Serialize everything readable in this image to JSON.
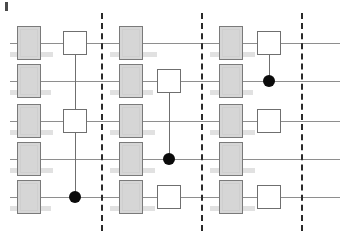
{
  "figure": {
    "kind": "quantum-circuit-diagram",
    "width": 347,
    "height": 243,
    "background": "#ffffff",
    "corner_mark": {
      "x": 5,
      "y": 2,
      "w": 3,
      "h": 9,
      "color": "#4a4a4a"
    }
  },
  "colors": {
    "wire": "#8e8e8e",
    "barrier": "#2a2a2a",
    "gate_fill": "#d6d6d6",
    "gate_stroke": "#7a7a7a",
    "square_fill": "#ffffff",
    "square_stroke": "#6f6f6f",
    "control_dot": "#0b0b0b",
    "label_smudge": "#dcdcdc"
  },
  "wires": [
    {
      "name": "qubit-wire-0",
      "y": 43,
      "x1": 10,
      "x2": 340
    },
    {
      "name": "qubit-wire-1",
      "y": 81,
      "x1": 10,
      "x2": 340
    },
    {
      "name": "qubit-wire-2",
      "y": 121,
      "x1": 10,
      "x2": 340
    },
    {
      "name": "qubit-wire-3",
      "y": 159,
      "x1": 10,
      "x2": 340
    },
    {
      "name": "qubit-wire-4",
      "y": 197,
      "x1": 10,
      "x2": 340
    }
  ],
  "barriers": [
    {
      "name": "barrier-1",
      "x": 101,
      "y1": 13,
      "y2": 231
    },
    {
      "name": "barrier-2",
      "x": 201,
      "y1": 13,
      "y2": 231
    },
    {
      "name": "barrier-3",
      "x": 301,
      "y1": 13,
      "y2": 231
    }
  ],
  "gate_boxes": [
    {
      "name": "gate-box-c0-r0",
      "x": 17,
      "y": 26,
      "w": 24,
      "h": 34
    },
    {
      "name": "gate-box-c0-r1",
      "x": 17,
      "y": 64,
      "w": 24,
      "h": 34
    },
    {
      "name": "gate-box-c0-r2",
      "x": 17,
      "y": 104,
      "w": 24,
      "h": 34
    },
    {
      "name": "gate-box-c0-r3",
      "x": 17,
      "y": 142,
      "w": 24,
      "h": 34
    },
    {
      "name": "gate-box-c0-r4",
      "x": 17,
      "y": 180,
      "w": 24,
      "h": 34
    },
    {
      "name": "gate-box-c1-r0",
      "x": 119,
      "y": 26,
      "w": 24,
      "h": 34
    },
    {
      "name": "gate-box-c1-r1",
      "x": 119,
      "y": 64,
      "w": 24,
      "h": 34
    },
    {
      "name": "gate-box-c1-r2",
      "x": 119,
      "y": 104,
      "w": 24,
      "h": 34
    },
    {
      "name": "gate-box-c1-r3",
      "x": 119,
      "y": 142,
      "w": 24,
      "h": 34
    },
    {
      "name": "gate-box-c1-r4",
      "x": 119,
      "y": 180,
      "w": 24,
      "h": 34
    },
    {
      "name": "gate-box-c2-r0",
      "x": 219,
      "y": 26,
      "w": 24,
      "h": 34
    },
    {
      "name": "gate-box-c2-r1",
      "x": 219,
      "y": 64,
      "w": 24,
      "h": 34
    },
    {
      "name": "gate-box-c2-r2",
      "x": 219,
      "y": 104,
      "w": 24,
      "h": 34
    },
    {
      "name": "gate-box-c2-r3",
      "x": 219,
      "y": 142,
      "w": 24,
      "h": 34
    },
    {
      "name": "gate-box-c2-r4",
      "x": 219,
      "y": 180,
      "w": 24,
      "h": 34
    }
  ],
  "square_gates": [
    {
      "name": "square-gate-r0-left",
      "x": 63,
      "y": 31,
      "size": 24
    },
    {
      "name": "square-gate-r2-left",
      "x": 63,
      "y": 109,
      "size": 24
    },
    {
      "name": "square-gate-r1-mid",
      "x": 157,
      "y": 69,
      "size": 24
    },
    {
      "name": "square-gate-r4-mid",
      "x": 157,
      "y": 185,
      "size": 24
    },
    {
      "name": "square-gate-r0-right",
      "x": 257,
      "y": 31,
      "size": 24
    },
    {
      "name": "square-gate-r2-right",
      "x": 257,
      "y": 109,
      "size": 24
    },
    {
      "name": "square-gate-r4-right",
      "x": 257,
      "y": 185,
      "size": 24
    }
  ],
  "control_links": [
    {
      "name": "control-link-left",
      "x": 75,
      "y1": 55,
      "y2": 197
    },
    {
      "name": "control-link-mid",
      "x": 169,
      "y1": 93,
      "y2": 159
    },
    {
      "name": "control-link-right",
      "x": 269,
      "y1": 55,
      "y2": 81
    }
  ],
  "control_dots": [
    {
      "name": "control-dot-left",
      "x": 75,
      "y": 197,
      "r": 6
    },
    {
      "name": "control-dot-mid",
      "x": 169,
      "y": 159,
      "r": 6
    },
    {
      "name": "control-dot-right",
      "x": 269,
      "y": 81,
      "r": 6
    }
  ],
  "label_smudges": [
    {
      "x": 10,
      "y": 52,
      "w": 9,
      "h": 5
    },
    {
      "x": 39,
      "y": 52,
      "w": 14,
      "h": 5
    },
    {
      "x": 10,
      "y": 90,
      "w": 9,
      "h": 5
    },
    {
      "x": 39,
      "y": 90,
      "w": 12,
      "h": 5
    },
    {
      "x": 10,
      "y": 130,
      "w": 9,
      "h": 5
    },
    {
      "x": 39,
      "y": 130,
      "w": 14,
      "h": 5
    },
    {
      "x": 10,
      "y": 168,
      "w": 9,
      "h": 5
    },
    {
      "x": 39,
      "y": 168,
      "w": 14,
      "h": 5
    },
    {
      "x": 10,
      "y": 206,
      "w": 9,
      "h": 5
    },
    {
      "x": 39,
      "y": 206,
      "w": 12,
      "h": 5
    },
    {
      "x": 110,
      "y": 52,
      "w": 9,
      "h": 5
    },
    {
      "x": 141,
      "y": 52,
      "w": 16,
      "h": 5
    },
    {
      "x": 110,
      "y": 90,
      "w": 9,
      "h": 5
    },
    {
      "x": 141,
      "y": 90,
      "w": 12,
      "h": 5
    },
    {
      "x": 110,
      "y": 130,
      "w": 9,
      "h": 5
    },
    {
      "x": 141,
      "y": 130,
      "w": 14,
      "h": 5
    },
    {
      "x": 110,
      "y": 168,
      "w": 9,
      "h": 5
    },
    {
      "x": 141,
      "y": 168,
      "w": 14,
      "h": 5
    },
    {
      "x": 110,
      "y": 206,
      "w": 9,
      "h": 5
    },
    {
      "x": 141,
      "y": 206,
      "w": 14,
      "h": 5
    },
    {
      "x": 210,
      "y": 52,
      "w": 9,
      "h": 5
    },
    {
      "x": 241,
      "y": 52,
      "w": 14,
      "h": 5
    },
    {
      "x": 210,
      "y": 90,
      "w": 9,
      "h": 5
    },
    {
      "x": 241,
      "y": 90,
      "w": 12,
      "h": 5
    },
    {
      "x": 210,
      "y": 130,
      "w": 9,
      "h": 5
    },
    {
      "x": 241,
      "y": 130,
      "w": 14,
      "h": 5
    },
    {
      "x": 210,
      "y": 168,
      "w": 9,
      "h": 5
    },
    {
      "x": 241,
      "y": 168,
      "w": 14,
      "h": 5
    },
    {
      "x": 210,
      "y": 206,
      "w": 9,
      "h": 5
    },
    {
      "x": 241,
      "y": 206,
      "w": 14,
      "h": 5
    }
  ]
}
